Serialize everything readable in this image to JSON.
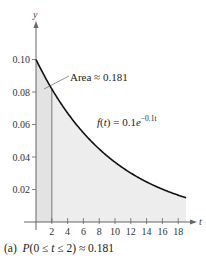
{
  "chart_data": {
    "type": "area",
    "title": "",
    "function": "f(t) = 0.1e^{-0.1t}",
    "function_label": {
      "prefix": "f(t) = 0.1e",
      "exponent": "−0.1t"
    },
    "xlabel": "t",
    "ylabel": "y",
    "xlim": [
      0,
      19
    ],
    "ylim": [
      0,
      0.1
    ],
    "x_ticks": [
      2,
      4,
      6,
      8,
      10,
      12,
      14,
      16,
      18
    ],
    "y_ticks": [
      0.02,
      0.04,
      0.06,
      0.08,
      0.1
    ],
    "y_tick_labels": [
      "0.02",
      "0.04",
      "0.06",
      "0.08",
      "0.10"
    ],
    "x": [
      0,
      1,
      2,
      3,
      4,
      5,
      6,
      7,
      8,
      9,
      10,
      11,
      12,
      13,
      14,
      15,
      16,
      17,
      18,
      19
    ],
    "values": [
      0.1,
      0.0905,
      0.0819,
      0.0741,
      0.067,
      0.0607,
      0.0549,
      0.0497,
      0.0449,
      0.0407,
      0.0368,
      0.0333,
      0.0301,
      0.0273,
      0.0247,
      0.0223,
      0.0202,
      0.0183,
      0.0165,
      0.015
    ],
    "shaded_region": {
      "from": 0,
      "to": 2,
      "area": 0.181
    },
    "annotation": "Area ≈ 0.181",
    "grid": false,
    "legend": "none"
  },
  "caption": {
    "part": "(a)",
    "expression_P": "P",
    "expression_mid": "(0 ≤ ",
    "expression_t": "t",
    "expression_end": " ≤ 2) ≈ 0.181"
  },
  "colors": {
    "curve": "#111111",
    "fill": "#ececec",
    "fill_highlight": "#e2e2e2",
    "axis": "#555555",
    "marker_line": "#8a8a8a"
  }
}
